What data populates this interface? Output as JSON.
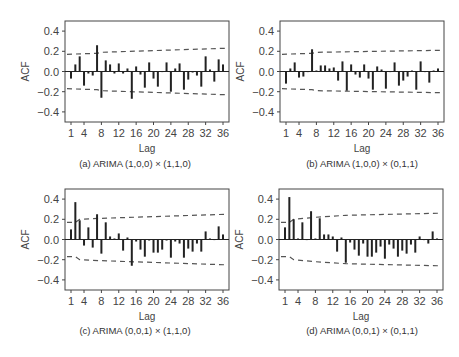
{
  "chart_data": [
    {
      "type": "bar",
      "id": "a",
      "title": "(a) ARIMA (1,0,0) × (1,1,0)",
      "xlabel": "Lag",
      "ylabel": "ACF",
      "ylim": [
        -0.5,
        0.5
      ],
      "yticks": [
        "0.4",
        "0.2",
        "0.0",
        "-0.2",
        "-0.4"
      ],
      "xticks": [
        "1",
        "4",
        "8",
        "12",
        "16",
        "20",
        "24",
        "28",
        "32",
        "36"
      ],
      "x": [
        1,
        2,
        3,
        4,
        5,
        6,
        7,
        8,
        9,
        10,
        11,
        12,
        13,
        14,
        15,
        16,
        17,
        18,
        19,
        20,
        21,
        22,
        23,
        24,
        25,
        26,
        27,
        28,
        29,
        30,
        31,
        32,
        33,
        34,
        35,
        36
      ],
      "values": [
        -0.07,
        0.07,
        0.15,
        -0.14,
        -0.02,
        -0.04,
        0.26,
        -0.26,
        0.11,
        0.07,
        -0.02,
        0.08,
        -0.02,
        0.03,
        -0.27,
        0.05,
        -0.03,
        -0.16,
        0.09,
        -0.07,
        -0.15,
        0.0,
        0.09,
        -0.2,
        0.03,
        0.08,
        -0.18,
        -0.08,
        -0.01,
        -0.04,
        -0.15,
        0.15,
        0.02,
        -0.1,
        0.12,
        0.07
      ],
      "confidence_band": {
        "lags": [
          1,
          7,
          8,
          36
        ],
        "upper": [
          0.17,
          0.18,
          0.19,
          0.23
        ]
      }
    },
    {
      "type": "bar",
      "id": "b",
      "title": "(b) ARIMA (1,0,0) × (0,1,1)",
      "xlabel": "Lag",
      "ylabel": "ACF",
      "ylim": [
        -0.5,
        0.5
      ],
      "yticks": [
        "0.4",
        "0.2",
        "0.0",
        "-0.2",
        "-0.4"
      ],
      "xticks": [
        "1",
        "4",
        "8",
        "12",
        "16",
        "20",
        "24",
        "28",
        "32",
        "36"
      ],
      "x": [
        1,
        2,
        3,
        4,
        5,
        6,
        7,
        8,
        9,
        10,
        11,
        12,
        13,
        14,
        15,
        16,
        17,
        18,
        19,
        20,
        21,
        22,
        23,
        24,
        25,
        26,
        27,
        28,
        29,
        30,
        31,
        32,
        33,
        34,
        35,
        36
      ],
      "values": [
        -0.12,
        0.03,
        0.09,
        -0.06,
        -0.05,
        0.0,
        0.22,
        0.01,
        0.06,
        0.06,
        0.03,
        0.04,
        -0.09,
        0.1,
        -0.19,
        0.07,
        -0.03,
        -0.06,
        0.07,
        -0.07,
        -0.18,
        0.05,
        0.02,
        -0.17,
        0.0,
        0.09,
        -0.14,
        -0.09,
        -0.05,
        0.01,
        -0.18,
        0.1,
        0.0,
        -0.11,
        0.01,
        0.03
      ],
      "confidence_band": {
        "lags": [
          1,
          7,
          8,
          36
        ],
        "upper": [
          0.17,
          0.18,
          0.19,
          0.21
        ]
      }
    },
    {
      "type": "bar",
      "id": "c",
      "title": "(c) ARIMA (0,0,1) × (1,1,0)",
      "xlabel": "Lag",
      "ylabel": "ACF",
      "ylim": [
        -0.5,
        0.5
      ],
      "yticks": [
        "0.4",
        "0.2",
        "0.0",
        "-0.2",
        "-0.4"
      ],
      "xticks": [
        "1",
        "4",
        "8",
        "12",
        "16",
        "20",
        "24",
        "28",
        "32",
        "36"
      ],
      "x": [
        1,
        2,
        3,
        4,
        5,
        6,
        7,
        8,
        9,
        10,
        11,
        12,
        13,
        14,
        15,
        16,
        17,
        18,
        19,
        20,
        21,
        22,
        23,
        24,
        25,
        26,
        27,
        28,
        29,
        30,
        31,
        32,
        33,
        34,
        35,
        36
      ],
      "values": [
        0.1,
        0.37,
        0.19,
        -0.06,
        0.12,
        -0.08,
        0.25,
        -0.14,
        0.17,
        0.03,
        0.01,
        0.06,
        -0.11,
        0.02,
        -0.26,
        -0.02,
        -0.1,
        -0.17,
        -0.01,
        -0.13,
        -0.13,
        -0.1,
        -0.01,
        -0.18,
        -0.02,
        -0.04,
        -0.18,
        -0.09,
        -0.12,
        -0.04,
        -0.12,
        0.08,
        0.01,
        0.0,
        0.13,
        0.05
      ],
      "confidence_band": {
        "lags": [
          1,
          2,
          3,
          8,
          36
        ],
        "upper": [
          0.17,
          0.17,
          0.2,
          0.21,
          0.25
        ]
      }
    },
    {
      "type": "bar",
      "id": "d",
      "title": "(d) ARIMA (0,0,1) × (0,1,1)",
      "xlabel": "Lag",
      "ylabel": "ACF",
      "ylim": [
        -0.5,
        0.5
      ],
      "yticks": [
        "0.4",
        "0.2",
        "0.0",
        "-0.2",
        "-0.4"
      ],
      "xticks": [
        "1",
        "4",
        "8",
        "12",
        "16",
        "20",
        "24",
        "28",
        "32",
        "36"
      ],
      "x": [
        1,
        2,
        3,
        4,
        5,
        6,
        7,
        8,
        9,
        10,
        11,
        12,
        13,
        14,
        15,
        16,
        17,
        18,
        19,
        20,
        21,
        22,
        23,
        24,
        25,
        26,
        27,
        28,
        29,
        30,
        31,
        32,
        33,
        34,
        35,
        36
      ],
      "values": [
        0.12,
        0.42,
        0.2,
        0.01,
        0.17,
        0.0,
        0.28,
        0.01,
        0.21,
        0.05,
        0.05,
        0.03,
        -0.12,
        0.02,
        -0.23,
        -0.03,
        -0.1,
        -0.16,
        -0.04,
        -0.17,
        -0.17,
        -0.13,
        -0.07,
        -0.19,
        -0.05,
        -0.09,
        -0.17,
        -0.11,
        -0.14,
        -0.05,
        -0.13,
        0.03,
        0.0,
        -0.04,
        0.08,
        0.01
      ],
      "confidence_band": {
        "lags": [
          1,
          2,
          3,
          8,
          15,
          36
        ],
        "upper": [
          0.17,
          0.17,
          0.2,
          0.22,
          0.24,
          0.26
        ]
      }
    }
  ],
  "colors": {
    "bar": "#222222",
    "frame": "#444444",
    "band": "#555555",
    "text": "#444444"
  }
}
